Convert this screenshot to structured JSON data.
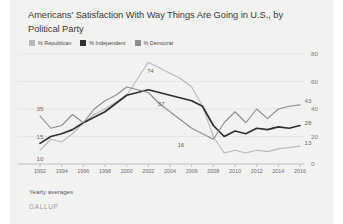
{
  "card": {
    "background_color": "#f2f2f0"
  },
  "header": {
    "title": "Americans' Satisfaction With Way Things Are Going in U.S., by Political Party"
  },
  "legend": {
    "position": "top-left",
    "items": [
      {
        "label": "% Republican",
        "color": "#b9b9b9",
        "key": "republican"
      },
      {
        "label": "% Independent",
        "color": "#2f2f2f",
        "key": "independent"
      },
      {
        "label": "% Democrat",
        "color": "#8d8d8d",
        "key": "democrat"
      }
    ]
  },
  "footer": {
    "note": "Yearly averages",
    "brand": "GALLUP"
  },
  "chart_data": {
    "type": "line",
    "title": "Americans' Satisfaction With Way Things Are Going in U.S., by Political Party",
    "xlabel": "",
    "ylabel": "",
    "ylim": [
      0,
      80
    ],
    "yticks": [
      0,
      20,
      40,
      60,
      80
    ],
    "ytick_labels": [
      "0",
      "20",
      "40",
      "60",
      "80"
    ],
    "y_axis_position": "right",
    "grid": true,
    "legend_position": "top-left",
    "x": [
      1992,
      1993,
      1994,
      1995,
      1996,
      1997,
      1998,
      1999,
      2000,
      2001,
      2002,
      2003,
      2004,
      2005,
      2006,
      2007,
      2008,
      2009,
      2010,
      2011,
      2012,
      2013,
      2014,
      2015,
      2016
    ],
    "xticks": [
      1992,
      1994,
      1996,
      1998,
      2000,
      2002,
      2004,
      2006,
      2008,
      2010,
      2012,
      2014,
      2016
    ],
    "xtick_labels": [
      "1992",
      "1994",
      "1996",
      "1998",
      "2000",
      "2002",
      "2004",
      "2006",
      "2008",
      "2010",
      "2012",
      "2014",
      "2016"
    ],
    "series": [
      {
        "name": "% Republican",
        "color": "#b9b9b9",
        "values": [
          10,
          18,
          16,
          22,
          30,
          36,
          40,
          45,
          50,
          62,
          74,
          70,
          66,
          62,
          56,
          42,
          20,
          8,
          10,
          8,
          10,
          9,
          11,
          12,
          13
        ],
        "start_label": "10",
        "peak_label": "74",
        "end_label": "13"
      },
      {
        "name": "% Independent",
        "color": "#2f2f2f",
        "values": [
          15,
          20,
          22,
          25,
          30,
          34,
          38,
          44,
          50,
          52,
          54,
          52,
          50,
          48,
          46,
          42,
          28,
          20,
          24,
          22,
          26,
          25,
          27,
          26,
          28
        ],
        "start_label": "15",
        "mid_label": "37",
        "end_label": "28"
      },
      {
        "name": "% Democrat",
        "color": "#8d8d8d",
        "values": [
          35,
          26,
          28,
          36,
          30,
          40,
          46,
          50,
          56,
          54,
          52,
          44,
          38,
          32,
          26,
          22,
          18,
          30,
          38,
          30,
          40,
          33,
          40,
          42,
          43
        ],
        "start_label": "35",
        "trough_label": "16",
        "end_label": "43"
      }
    ],
    "point_labels": [
      {
        "text": "35",
        "x": 1992,
        "y": 35,
        "dx": 0,
        "dy": -8
      },
      {
        "text": "15",
        "x": 1992,
        "y": 15,
        "dx": 0,
        "dy": -7
      },
      {
        "text": "10",
        "x": 1992,
        "y": 10,
        "dx": 0,
        "dy": 8
      },
      {
        "text": "74",
        "x": 2002,
        "y": 74,
        "dx": 2,
        "dy": 8
      },
      {
        "text": "37",
        "x": 2003,
        "y": 47,
        "dx": 2,
        "dy": 4
      },
      {
        "text": "16",
        "x": 2005,
        "y": 20,
        "dx": 0,
        "dy": 7
      },
      {
        "text": "43",
        "x": 2016,
        "y": 43,
        "dx": 8,
        "dy": -5
      },
      {
        "text": "28",
        "x": 2016,
        "y": 28,
        "dx": 8,
        "dy": -4
      },
      {
        "text": "13",
        "x": 2016,
        "y": 13,
        "dx": 8,
        "dy": -4
      }
    ]
  }
}
